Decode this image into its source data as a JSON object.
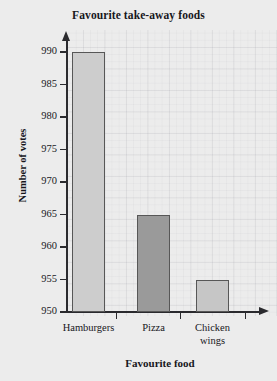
{
  "chart_data": {
    "type": "bar",
    "title": "Favourite take-away foods",
    "xlabel": "Favourite food",
    "ylabel": "Number of votes",
    "categories": [
      "Hamburgers",
      "Pizza",
      "Chicken wings"
    ],
    "values": [
      990,
      965,
      955
    ],
    "ylim": [
      950,
      990
    ],
    "yticks": [
      950,
      955,
      960,
      965,
      970,
      975,
      980,
      985,
      990
    ],
    "ytick_labels": [
      "950",
      "955",
      "960",
      "965",
      "970",
      "975",
      "980",
      "985",
      "990"
    ],
    "grid": true,
    "legend": "none",
    "bar_colors": [
      "#cdcdcd",
      "#9a9a9a",
      "#c6c6c6"
    ],
    "bar_border_color": "#575757",
    "axis_color": "#2a2a2e",
    "background_color": "#ececec",
    "text_color": "#17171c",
    "category_label_lines": [
      [
        "Hamburgers"
      ],
      [
        "Pizza"
      ],
      [
        "Chicken",
        "wings"
      ]
    ]
  }
}
